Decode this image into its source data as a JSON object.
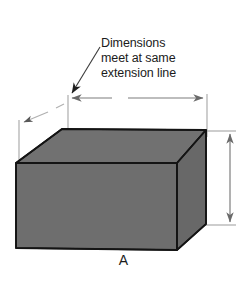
{
  "figure": {
    "label": "A",
    "annotation": {
      "lines": [
        "Dimensions",
        "meet at same",
        "extension line"
      ]
    },
    "colors": {
      "background": "#ffffff",
      "face_top": "#6f6f6f",
      "face_front": "#6e6e6e",
      "face_right": "#676767",
      "outline": "#1a1a1a",
      "text": "#1b1b1b",
      "dimension_line": "#7d7d7d",
      "extension_line": "#9a9a9a",
      "leader_line": "#3a3a3a"
    },
    "elements": {
      "solid_name": "rectangular-block",
      "horizontal_dimension_label": "",
      "vertical_dimension_label": "",
      "diagonal_dimension_label": ""
    }
  }
}
